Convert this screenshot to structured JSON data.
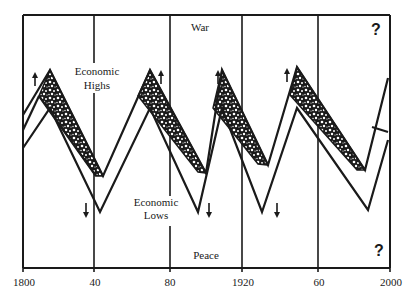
{
  "labels": {
    "top_region": "War",
    "bottom_region": "Peace",
    "highs_line1": "Economic",
    "highs_line2": "Highs",
    "lows_line1": "Economic",
    "lows_line2": "Lows",
    "question_top": "?",
    "question_bottom": "?"
  },
  "x_axis": {
    "ticks": [
      "1800",
      "40",
      "80",
      "1920",
      "60",
      "2000"
    ]
  },
  "colors": {
    "ink": "#1a1a1a",
    "background": "#ffffff"
  }
}
